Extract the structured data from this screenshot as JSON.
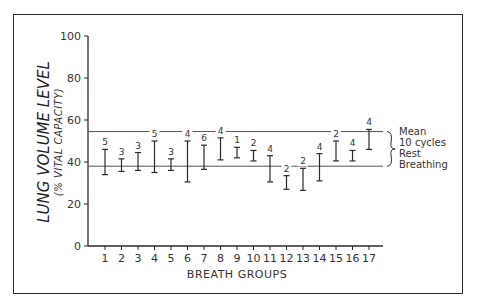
{
  "chart_data": {
    "type": "errorbar",
    "title": "",
    "xlabel": "BREATH GROUPS",
    "ylabel": "LUNG VOLUME LEVEL",
    "ylabel_sub": "(% VITAL CAPACITY)",
    "ylim": [
      0,
      100
    ],
    "yticks": [
      0,
      20,
      40,
      60,
      80,
      100
    ],
    "categories": [
      "1",
      "2",
      "3",
      "4",
      "5",
      "6",
      "7",
      "8",
      "9",
      "10",
      "11",
      "12",
      "13",
      "14",
      "15",
      "16",
      "17"
    ],
    "ranges": [
      {
        "group": 1,
        "low": 34,
        "high": 46,
        "n": 5
      },
      {
        "group": 2,
        "low": 35.5,
        "high": 41.5,
        "n": 3
      },
      {
        "group": 3,
        "low": 36,
        "high": 44.5,
        "n": 3
      },
      {
        "group": 4,
        "low": 35,
        "high": 50,
        "n": 5
      },
      {
        "group": 5,
        "low": 36,
        "high": 41.5,
        "n": 3
      },
      {
        "group": 6,
        "low": 30.5,
        "high": 50,
        "n": 4
      },
      {
        "group": 7,
        "low": 36.5,
        "high": 48,
        "n": 6
      },
      {
        "group": 8,
        "low": 41,
        "high": 51.5,
        "n": 4
      },
      {
        "group": 9,
        "low": 42,
        "high": 47,
        "n": 1
      },
      {
        "group": 10,
        "low": 40.5,
        "high": 45.5,
        "n": 2
      },
      {
        "group": 11,
        "low": 30.5,
        "high": 43,
        "n": 4
      },
      {
        "group": 12,
        "low": 27,
        "high": 33.5,
        "n": 2
      },
      {
        "group": 13,
        "low": 26.5,
        "high": 37,
        "n": 2
      },
      {
        "group": 14,
        "low": 31,
        "high": 44,
        "n": 4
      },
      {
        "group": 15,
        "low": 40.5,
        "high": 50,
        "n": 2
      },
      {
        "group": 16,
        "low": 40.5,
        "high": 45.5,
        "n": 4
      },
      {
        "group": 17,
        "low": 46,
        "high": 55.5,
        "n": 4
      }
    ],
    "reference_band": {
      "low": 38,
      "high": 54.5
    },
    "legend": {
      "lines": [
        "Mean",
        "10 cycles",
        "Rest",
        "Breathing"
      ],
      "position": "right"
    },
    "grid": false
  }
}
